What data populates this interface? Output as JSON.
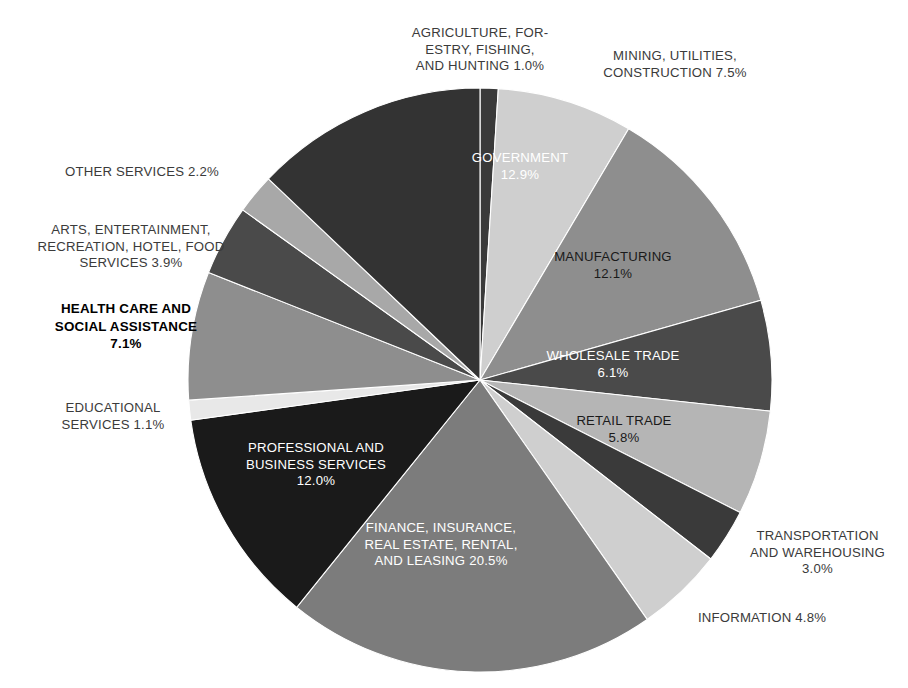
{
  "chart_data": {
    "type": "pie",
    "title": "",
    "subtitle": "",
    "xlabel": "",
    "ylabel": "",
    "legend_position": "none",
    "grid": false,
    "units": "percent",
    "start_angle_deg": 0,
    "direction": "clockwise",
    "categories": [
      "AGRICULTURE, FORESTRY, FISHING, AND HUNTING",
      "MINING, UTILITIES, CONSTRUCTION",
      "MANUFACTURING",
      "WHOLESALE TRADE",
      "RETAIL TRADE",
      "TRANSPORTATION AND WAREHOUSING",
      "INFORMATION",
      "FINANCE, INSURANCE, REAL ESTATE, RENTAL, AND LEASING",
      "PROFESSIONAL AND BUSINESS SERVICES",
      "EDUCATIONAL SERVICES",
      "HEALTH CARE AND SOCIAL ASSISTANCE",
      "ARTS, ENTERTAINMENT, RECREATION, HOTEL, FOOD SERVICES",
      "OTHER SERVICES",
      "GOVERNMENT"
    ],
    "values": [
      1.0,
      7.5,
      12.1,
      6.1,
      5.8,
      3.0,
      4.8,
      20.5,
      12.0,
      1.1,
      7.1,
      3.9,
      2.2,
      12.9
    ],
    "colors": [
      "#3a3a3a",
      "#cfcfcf",
      "#8e8e8e",
      "#4a4a4a",
      "#b5b5b5",
      "#3a3a3a",
      "#cfcfcf",
      "#7c7c7c",
      "#1a1a1a",
      "#e8e8e8",
      "#8e8e8e",
      "#4a4a4a",
      "#a8a8a8",
      "#333333"
    ],
    "slices": [
      {
        "label": "AGRICULTURE, FORESTRY, FISHING, AND HUNTING",
        "value": 1.0,
        "value_text": "1.0%",
        "color": "#3a3a3a"
      },
      {
        "label": "MINING, UTILITIES, CONSTRUCTION",
        "value": 7.5,
        "value_text": "7.5%",
        "color": "#cfcfcf"
      },
      {
        "label": "MANUFACTURING",
        "value": 12.1,
        "value_text": "12.1%",
        "color": "#8e8e8e"
      },
      {
        "label": "WHOLESALE TRADE",
        "value": 6.1,
        "value_text": "6.1%",
        "color": "#4a4a4a"
      },
      {
        "label": "RETAIL TRADE",
        "value": 5.8,
        "value_text": "5.8%",
        "color": "#b5b5b5"
      },
      {
        "label": "TRANSPORTATION AND WAREHOUSING",
        "value": 3.0,
        "value_text": "3.0%",
        "color": "#3a3a3a"
      },
      {
        "label": "INFORMATION",
        "value": 4.8,
        "value_text": "4.8%",
        "color": "#cfcfcf"
      },
      {
        "label": "FINANCE, INSURANCE, REAL ESTATE, RENTAL, AND LEASING",
        "value": 20.5,
        "value_text": "20.5%",
        "color": "#7c7c7c"
      },
      {
        "label": "PROFESSIONAL AND BUSINESS SERVICES",
        "value": 12.0,
        "value_text": "12.0%",
        "color": "#1a1a1a"
      },
      {
        "label": "EDUCATIONAL SERVICES",
        "value": 1.1,
        "value_text": "1.1%",
        "color": "#e8e8e8"
      },
      {
        "label": "HEALTH CARE AND SOCIAL ASSISTANCE",
        "value": 7.1,
        "value_text": "7.1%",
        "color": "#8e8e8e"
      },
      {
        "label": "ARTS, ENTERTAINMENT, RECREATION, HOTEL, FOOD SERVICES",
        "value": 3.9,
        "value_text": "3.9%",
        "color": "#4a4a4a"
      },
      {
        "label": "OTHER SERVICES",
        "value": 2.2,
        "value_text": "2.2%",
        "color": "#a8a8a8"
      },
      {
        "label": "GOVERNMENT",
        "value": 12.9,
        "value_text": "12.9%",
        "color": "#333333"
      }
    ]
  },
  "labels": {
    "agriculture": "AGRICULTURE, FOR-\nESTRY, FISHING,\nAND HUNTING 1.0%",
    "mining": "MINING, UTILITIES,\nCONSTRUCTION 7.5%",
    "manufacturing": "MANUFACTURING\n12.1%",
    "wholesale": "WHOLESALE TRADE\n6.1%",
    "retail": "RETAIL TRADE\n5.8%",
    "transportation": "TRANSPORTATION\nAND WAREHOUSING\n3.0%",
    "information": "INFORMATION 4.8%",
    "finance": "FINANCE, INSURANCE,\nREAL ESTATE, RENTAL,\nAND LEASING 20.5%",
    "professional": "PROFESSIONAL AND\nBUSINESS SERVICES\n12.0%",
    "educational": "EDUCATIONAL\nSERVICES 1.1%",
    "healthcare": "HEALTH CARE AND\nSOCIAL ASSISTANCE\n7.1%",
    "arts": "ARTS, ENTERTAINMENT,\nRECREATION, HOTEL, FOOD\nSERVICES 3.9%",
    "other_services": "OTHER SERVICES 2.2%",
    "government": "GOVERNMENT\n12.9%"
  },
  "geometry": {
    "center_x": 480,
    "center_y": 380,
    "radius": 292
  }
}
